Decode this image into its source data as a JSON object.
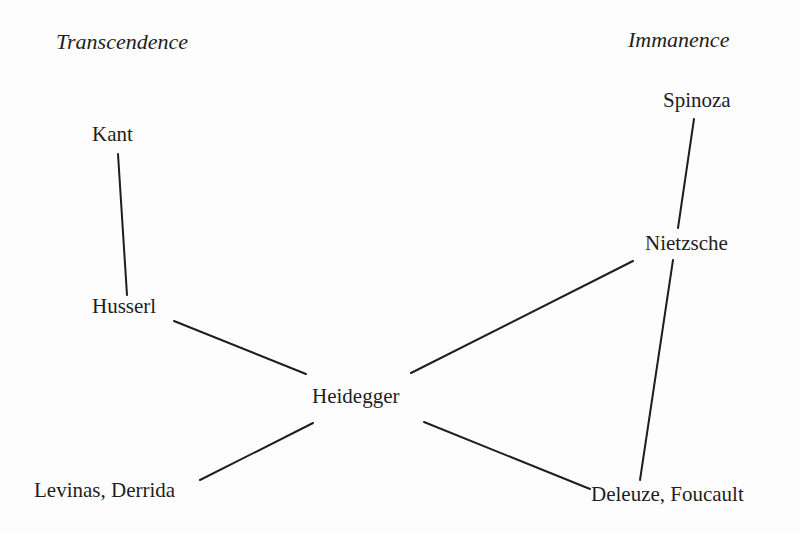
{
  "headers": {
    "left": "Transcendence",
    "right": "Immanence"
  },
  "nodes": {
    "kant": "Kant",
    "husserl": "Husserl",
    "heidegger": "Heidegger",
    "levinas_derrida": "Levinas, Derrida",
    "spinoza": "Spinoza",
    "nietzsche": "Nietzsche",
    "deleuze_foucault": "Deleuze, Foucault"
  },
  "edges": [
    {
      "from": "Kant",
      "to": "Husserl"
    },
    {
      "from": "Husserl",
      "to": "Heidegger"
    },
    {
      "from": "Heidegger",
      "to": "Levinas, Derrida"
    },
    {
      "from": "Spinoza",
      "to": "Nietzsche"
    },
    {
      "from": "Nietzsche",
      "to": "Heidegger"
    },
    {
      "from": "Nietzsche",
      "to": "Deleuze, Foucault"
    },
    {
      "from": "Heidegger",
      "to": "Deleuze, Foucault"
    }
  ],
  "colors": {
    "ink": "#1e1e1e",
    "background": "#fdfdfd"
  }
}
